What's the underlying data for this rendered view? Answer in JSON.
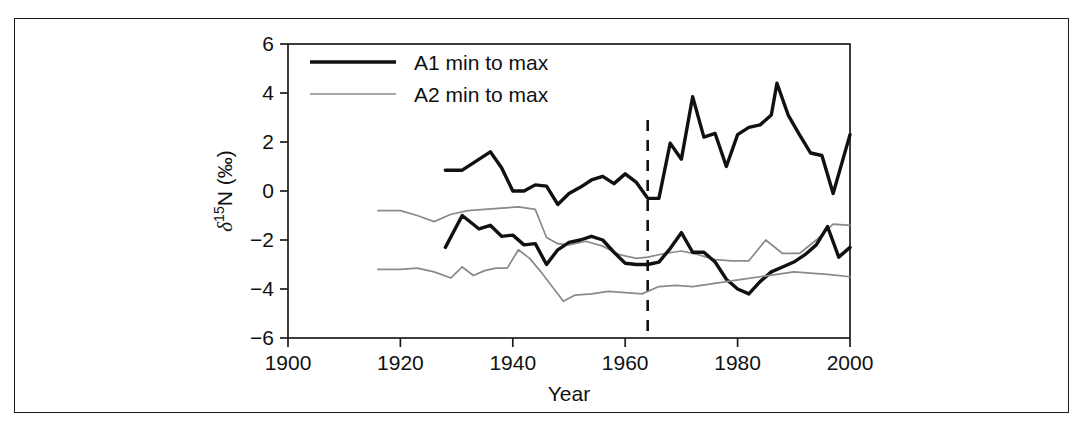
{
  "figure": {
    "frame_color": "#1c1c1c",
    "background": "#ffffff"
  },
  "chart_data": {
    "type": "line",
    "title": "",
    "xlabel": "Year",
    "ylabel": "δ¹⁵N (‰)",
    "xlim": [
      1900,
      2000
    ],
    "ylim": [
      -6,
      6
    ],
    "xticks": [
      1900,
      1920,
      1940,
      1960,
      1980,
      2000
    ],
    "xtick_labels": [
      "1900",
      "1920",
      "1940",
      "1960",
      "1980",
      "2000"
    ],
    "yticks": [
      -6,
      -4,
      -2,
      0,
      2,
      4,
      6
    ],
    "ytick_labels": [
      "−6",
      "−4",
      "−2",
      "0",
      "2",
      "4",
      "6"
    ],
    "grid": false,
    "legend_position": "top-left",
    "legend": [
      {
        "label": "A1 min to max",
        "color": "#111111",
        "width": 3.4,
        "style": "solid"
      },
      {
        "label": "A2 min to max",
        "color": "#8a8a8a",
        "width": 1.7,
        "style": "solid"
      }
    ],
    "annotations": [
      {
        "type": "vline",
        "x": 1964,
        "style": "dashed",
        "color": "#111111",
        "width": 2.6
      }
    ],
    "series": [
      {
        "name": "A1 max",
        "color": "#111111",
        "width": 3.4,
        "style": "solid",
        "x": [
          1928,
          1931,
          1933,
          1936,
          1938,
          1940,
          1942,
          1944,
          1946,
          1948,
          1950,
          1952,
          1954,
          1956,
          1958,
          1960,
          1962,
          1964,
          1966,
          1968,
          1970,
          1972,
          1974,
          1976,
          1978,
          1980,
          1982,
          1984,
          1986,
          1987,
          1989,
          1991,
          1993,
          1995,
          1997,
          2000
        ],
        "y": [
          0.85,
          0.85,
          1.15,
          1.6,
          0.95,
          0.0,
          0.0,
          0.25,
          0.2,
          -0.55,
          -0.1,
          0.15,
          0.45,
          0.6,
          0.3,
          0.7,
          0.35,
          -0.3,
          -0.3,
          1.95,
          1.3,
          3.85,
          2.2,
          2.35,
          1.0,
          2.3,
          2.6,
          2.7,
          3.1,
          4.4,
          3.1,
          2.3,
          1.55,
          1.45,
          -0.1,
          2.3
        ]
      },
      {
        "name": "A2 max",
        "color": "#8a8a8a",
        "width": 1.7,
        "style": "solid",
        "x": [
          1916,
          1920,
          1923,
          1926,
          1929,
          1932,
          1935,
          1938,
          1941,
          1944,
          1946,
          1948,
          1950,
          1953,
          1956,
          1959,
          1962,
          1964,
          1967,
          1970,
          1973,
          1976,
          1979,
          1982,
          1985,
          1988,
          1991,
          1994,
          1997,
          2000
        ],
        "y": [
          -0.8,
          -0.8,
          -1.0,
          -1.25,
          -0.95,
          -0.8,
          -0.75,
          -0.7,
          -0.65,
          -0.75,
          -1.9,
          -2.15,
          -2.2,
          -2.05,
          -2.25,
          -2.6,
          -2.75,
          -2.7,
          -2.55,
          -2.45,
          -2.6,
          -2.8,
          -2.85,
          -2.85,
          -2.0,
          -2.55,
          -2.55,
          -2.0,
          -1.35,
          -1.4
        ]
      },
      {
        "name": "A1 min",
        "color": "#111111",
        "width": 3.4,
        "style": "solid",
        "x": [
          1928,
          1931,
          1934,
          1936,
          1938,
          1940,
          1942,
          1944,
          1946,
          1948,
          1950,
          1952,
          1954,
          1956,
          1958,
          1960,
          1962,
          1964,
          1966,
          1968,
          1970,
          1972,
          1974,
          1976,
          1978,
          1980,
          1982,
          1984,
          1986,
          1988,
          1990,
          1992,
          1994,
          1996,
          1998,
          2000
        ],
        "y": [
          -2.3,
          -1.0,
          -1.55,
          -1.4,
          -1.85,
          -1.8,
          -2.2,
          -2.15,
          -3.0,
          -2.4,
          -2.1,
          -2.0,
          -1.85,
          -2.0,
          -2.5,
          -2.95,
          -3.0,
          -3.0,
          -2.9,
          -2.35,
          -1.7,
          -2.5,
          -2.5,
          -2.9,
          -3.6,
          -4.0,
          -4.2,
          -3.7,
          -3.3,
          -3.1,
          -2.9,
          -2.6,
          -2.2,
          -1.45,
          -2.7,
          -2.3
        ]
      },
      {
        "name": "A2 min",
        "color": "#8a8a8a",
        "width": 1.7,
        "style": "solid",
        "x": [
          1916,
          1920,
          1923,
          1926,
          1929,
          1931,
          1933,
          1935,
          1937,
          1939,
          1941,
          1943,
          1945,
          1947,
          1949,
          1951,
          1954,
          1957,
          1960,
          1963,
          1966,
          1969,
          1972,
          1975,
          1978,
          1981,
          1984,
          1987,
          1990,
          1993,
          1996,
          2000
        ],
        "y": [
          -3.2,
          -3.2,
          -3.15,
          -3.3,
          -3.55,
          -3.1,
          -3.45,
          -3.25,
          -3.15,
          -3.15,
          -2.4,
          -2.75,
          -3.3,
          -3.9,
          -4.5,
          -4.25,
          -4.2,
          -4.1,
          -4.15,
          -4.2,
          -3.9,
          -3.85,
          -3.9,
          -3.8,
          -3.7,
          -3.6,
          -3.5,
          -3.4,
          -3.3,
          -3.35,
          -3.4,
          -3.5
        ]
      }
    ]
  }
}
